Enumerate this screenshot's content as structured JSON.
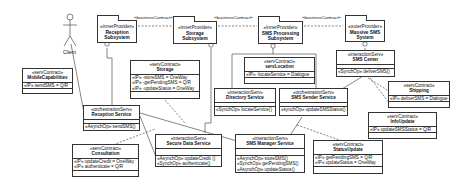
{
  "actor": {
    "name": "Client"
  },
  "packages": [
    {
      "id": "reception-subsystem",
      "stereotype": "«innerProvider»",
      "name_line1": "Reception",
      "name_line2": "Subsystem"
    },
    {
      "id": "storage-subsystem",
      "stereotype": "«innerProvider»",
      "name_line1": "Storage",
      "name_line2": "Subsystem"
    },
    {
      "id": "sms-processing-subsystem",
      "stereotype": "«innerProvider»",
      "name_line1": "SMS Processing",
      "name_line2": "Subsystem"
    },
    {
      "id": "massive-sms-system",
      "stereotype": "«outerProvider»",
      "name_line1": "Massive SMS",
      "name_line2": "System"
    }
  ],
  "business_contract_label": "«businessContract»",
  "contracts": {
    "mobile_capabilities": {
      "stereotype": "«servContract»",
      "name": "MobileCapabilities",
      "rows": [
        "«IP» sendSMS = Q/R"
      ]
    },
    "storage": {
      "stereotype": "«servContract»",
      "name": "Storage",
      "rows": [
        "«IP» -storeSMS = OneWay",
        "«IP» -getPendingSMS = Q/R",
        "«IP» -updateStatus = OneWay"
      ]
    },
    "serv_location": {
      "stereotype": "«servContract»",
      "name": "servLocation",
      "rows": [
        "«IP» -locateService = Dialogue"
      ]
    },
    "shipping": {
      "stereotype": "«servContract»",
      "name": "Shipping",
      "rows": [
        "«IP» deliverSMS = Dialogue"
      ]
    },
    "info_update": {
      "stereotype": "«servContract»",
      "name": "InfoUpdate",
      "rows": [
        "«IP» updateSMSStatus = Q/R"
      ]
    },
    "consultation": {
      "stereotype": "«servContract»",
      "name": "Consultation",
      "rows": [
        "«IP» updateCredit = OneWay",
        "«IP» authenticate = Q/R"
      ]
    },
    "status_update": {
      "stereotype": "«servContract»",
      "name": "StatusUpdate",
      "rows": [
        "«IP» getPendingSMS = Q/R",
        "«IP» updateStatus = OneWay"
      ]
    }
  },
  "services": {
    "reception_service": {
      "stereotype": "«orchestrationServ»",
      "name": "Reception Service",
      "ops": [
        "«AsynchOp» sendSMS()"
      ]
    },
    "directory_service": {
      "stereotype": "«interactionServ»",
      "name": "Directory Service",
      "ops": [
        "«SynchOp» locateService()"
      ]
    },
    "sms_sender_service": {
      "stereotype": "«orchestrationServ»",
      "name": "SMS Sender Service",
      "ops": [
        "«synchOp» updateSMSStatus()"
      ]
    },
    "sms_center": {
      "stereotype": "«interactionServ»",
      "name": "SMS Center",
      "ops": [
        "«SynchOp» deliverSMS()"
      ]
    },
    "secure_data_service": {
      "stereotype": "«interactionServ»",
      "name": "Secure Data Service",
      "ops": [
        "«AsynchOp» updateCredit ()",
        "«SynchOp» authenticate()"
      ]
    },
    "sms_manager_service": {
      "stereotype": "«interactionServ»",
      "name": "SMS Manager Service",
      "ops": [
        "«AsynchOp» storeSMS()",
        "«SynchOp» getPendingSMS()",
        "«AsynchOp» updateStatus()"
      ]
    }
  }
}
